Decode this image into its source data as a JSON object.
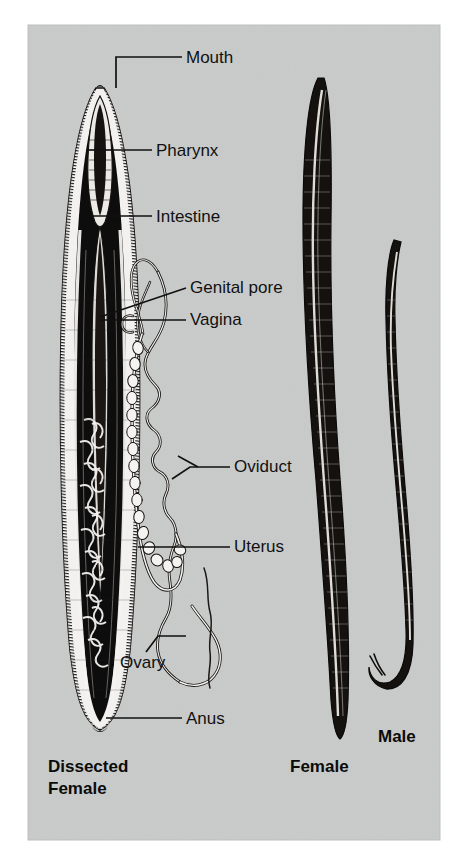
{
  "figure": {
    "background_color": "#ffffff",
    "panel_color": "#c9cbca",
    "ink_color": "#111111",
    "panel": {
      "x": 28,
      "y": 25,
      "width": 412,
      "height": 815
    }
  },
  "labels": [
    {
      "id": "mouth",
      "text": "Mouth",
      "text_x": 186,
      "text_y": 63,
      "leader": "M182,57 L116,57 L116,88"
    },
    {
      "id": "pharynx",
      "text": "Pharynx",
      "text_x": 156,
      "text_y": 156,
      "leader": "M152,150 L86,150"
    },
    {
      "id": "intestine",
      "text": "Intestine",
      "text_x": 156,
      "text_y": 222,
      "leader": "M152,216 L87,216"
    },
    {
      "id": "genital-pore",
      "text": "Genital pore",
      "text_x": 190,
      "text_y": 293,
      "leader": "M186,288 L100,317"
    },
    {
      "id": "vagina",
      "text": "Vagina",
      "text_x": 190,
      "text_y": 325,
      "leader": "M186,320 L100,320"
    },
    {
      "id": "oviduct",
      "text": "Oviduct",
      "text_x": 234,
      "text_y": 472,
      "leader": "M230,467 L190,467 L172,479"
    },
    {
      "id": "oviduct-2",
      "text": "",
      "text_x": 0,
      "text_y": 0,
      "leader": "M196,467 L176,457"
    },
    {
      "id": "uterus",
      "text": "Uterus",
      "text_x": 234,
      "text_y": 552,
      "leader": "M230,547 L138,547"
    },
    {
      "id": "ovary",
      "text": "Ovary",
      "text_x": 120,
      "text_y": 668,
      "leader": "M146,652 L158,636 L186,636"
    },
    {
      "id": "anus",
      "text": "Anus",
      "text_x": 186,
      "text_y": 724,
      "leader": "M182,718 L106,718"
    }
  ],
  "captions": [
    {
      "id": "dissected-female",
      "lines": [
        "Dissected",
        "Female"
      ],
      "x": 48,
      "y": 772
    },
    {
      "id": "female",
      "lines": [
        "Female"
      ],
      "x": 290,
      "y": 772
    },
    {
      "id": "male",
      "lines": [
        "Male"
      ],
      "x": 378,
      "y": 742
    }
  ],
  "specimens": [
    {
      "id": "dissected-female-worm",
      "name": "Dissected Female",
      "description": "Longitudinal section showing pharynx, intestine and reproductive tract"
    },
    {
      "id": "whole-female-worm",
      "name": "Female",
      "description": "Whole mount, long straight body tapering at both ends"
    },
    {
      "id": "whole-male-worm",
      "name": "Male",
      "description": "Whole mount, smaller body with hooked posterior end bearing spicules"
    }
  ],
  "organs": [
    {
      "id": "mouth-organ",
      "name": "Mouth"
    },
    {
      "id": "pharynx-organ",
      "name": "Pharynx"
    },
    {
      "id": "intestine-organ",
      "name": "Intestine"
    },
    {
      "id": "genital-pore-organ",
      "name": "Genital pore"
    },
    {
      "id": "vagina-organ",
      "name": "Vagina"
    },
    {
      "id": "oviduct-organ",
      "name": "Oviduct"
    },
    {
      "id": "uterus-organ",
      "name": "Uterus"
    },
    {
      "id": "ovary-organ",
      "name": "Ovary"
    },
    {
      "id": "anus-organ",
      "name": "Anus"
    }
  ]
}
